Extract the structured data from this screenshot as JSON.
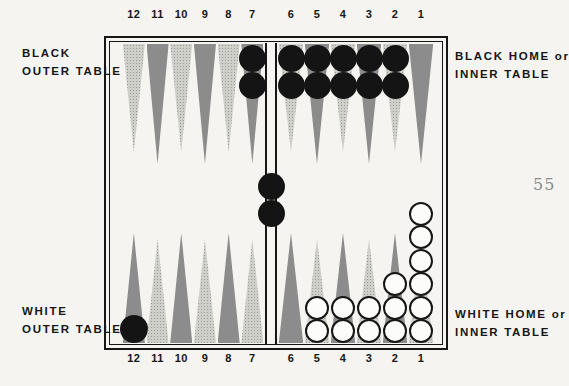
{
  "page_number": "55",
  "labels": {
    "black_outer": [
      "BLACK",
      "OUTER TABLE"
    ],
    "black_home": [
      "BLACK HOME or",
      "INNER TABLE"
    ],
    "white_outer": [
      "WHITE",
      "OUTER TABLE"
    ],
    "white_home": [
      "WHITE HOME or",
      "INNER TABLE"
    ]
  },
  "board": {
    "top_point_numbers": [
      "12",
      "11",
      "10",
      "9",
      "8",
      "7",
      "6",
      "5",
      "4",
      "3",
      "2",
      "1"
    ],
    "bottom_point_numbers": [
      "12",
      "11",
      "10",
      "9",
      "8",
      "7",
      "6",
      "5",
      "4",
      "3",
      "2",
      "1"
    ],
    "top_points": [
      {
        "number": "12",
        "shade": "light",
        "checkers": 0,
        "checker_color": null
      },
      {
        "number": "11",
        "shade": "dark",
        "checkers": 0,
        "checker_color": null
      },
      {
        "number": "10",
        "shade": "light",
        "checkers": 0,
        "checker_color": null
      },
      {
        "number": "9",
        "shade": "dark",
        "checkers": 0,
        "checker_color": null
      },
      {
        "number": "8",
        "shade": "light",
        "checkers": 0,
        "checker_color": null
      },
      {
        "number": "7",
        "shade": "dark",
        "checkers": 2,
        "checker_color": "black"
      },
      {
        "number": "6",
        "shade": "light",
        "checkers": 2,
        "checker_color": "black"
      },
      {
        "number": "5",
        "shade": "dark",
        "checkers": 2,
        "checker_color": "black"
      },
      {
        "number": "4",
        "shade": "light",
        "checkers": 2,
        "checker_color": "black"
      },
      {
        "number": "3",
        "shade": "dark",
        "checkers": 2,
        "checker_color": "black"
      },
      {
        "number": "2",
        "shade": "light",
        "checkers": 2,
        "checker_color": "black"
      },
      {
        "number": "1",
        "shade": "dark",
        "checkers": 0,
        "checker_color": null
      }
    ],
    "bottom_points": [
      {
        "number": "12",
        "shade": "dark",
        "checkers": 1,
        "checker_color": "black"
      },
      {
        "number": "11",
        "shade": "light",
        "checkers": 0,
        "checker_color": null
      },
      {
        "number": "10",
        "shade": "dark",
        "checkers": 0,
        "checker_color": null
      },
      {
        "number": "9",
        "shade": "light",
        "checkers": 0,
        "checker_color": null
      },
      {
        "number": "8",
        "shade": "dark",
        "checkers": 0,
        "checker_color": null
      },
      {
        "number": "7",
        "shade": "light",
        "checkers": 0,
        "checker_color": null
      },
      {
        "number": "6",
        "shade": "dark",
        "checkers": 0,
        "checker_color": null
      },
      {
        "number": "5",
        "shade": "light",
        "checkers": 2,
        "checker_color": "white"
      },
      {
        "number": "4",
        "shade": "dark",
        "checkers": 2,
        "checker_color": "white"
      },
      {
        "number": "3",
        "shade": "light",
        "checkers": 2,
        "checker_color": "white"
      },
      {
        "number": "2",
        "shade": "dark",
        "checkers": 3,
        "checker_color": "white"
      },
      {
        "number": "1",
        "shade": "light",
        "checkers": 6,
        "checker_color": "white"
      }
    ],
    "bar_checkers": {
      "count": 2,
      "color": "black"
    }
  },
  "colors": {
    "paper": "#f5f4f0",
    "ink": "#161616",
    "point_light": "#cfcfca",
    "point_dark": "#8c8c8c",
    "checker_black": "#141414",
    "checker_white": "#fcfcfa",
    "page_number_gray": "#8b8b8b"
  }
}
